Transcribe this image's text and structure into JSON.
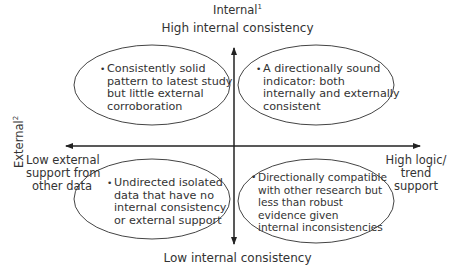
{
  "diagram": {
    "type": "2x2 matrix",
    "axes": {
      "vertical": {
        "title": "Internal",
        "title_footnote": "1",
        "top_label": "High internal consistency",
        "bottom_label": "Low internal consistency"
      },
      "horizontal": {
        "title": "External",
        "title_footnote": "2",
        "left_label": [
          "Low external",
          "support from",
          "other data"
        ],
        "right_label": [
          "High logic/",
          "trend",
          "support"
        ]
      }
    },
    "quadrants": {
      "top_left": [
        "Consistently solid",
        "pattern to latest study",
        "but little external",
        "corroboration"
      ],
      "top_right": [
        "A directionally sound",
        "indicator: both",
        "internally and externally",
        "consistent"
      ],
      "bottom_left": [
        "Undirected isolated",
        "data that have no",
        "internal consistency",
        "or external support"
      ],
      "bottom_right": [
        "Directionally compatible",
        "with other research but",
        "less than robust",
        "evidence given",
        "internal inconsistencies"
      ]
    },
    "colors": {
      "line": "#222222",
      "text": "#333333"
    }
  }
}
